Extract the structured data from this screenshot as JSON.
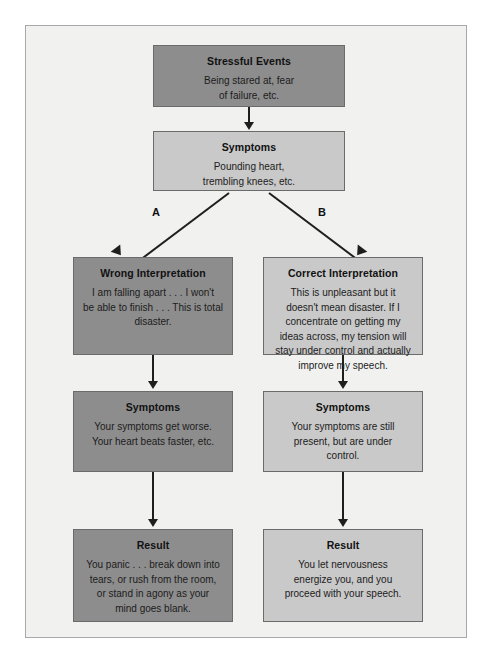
{
  "diagram": {
    "colors": {
      "page_background": "#ffffff",
      "panel_background": "#f1f1f0",
      "panel_border": "#a8a8a8",
      "node_dark": "#8d8d8d",
      "node_light": "#c9c9c9",
      "node_border": "#6b6b6b",
      "connector": "#1e1e1e",
      "text": "#1a1a1a"
    },
    "branch_labels": {
      "left": "A",
      "right": "B"
    },
    "nodes": {
      "stressful_events": {
        "title": "Stressful Events",
        "body": "Being stared at, fear\nof failure, etc."
      },
      "symptoms_top": {
        "title": "Symptoms",
        "body": "Pounding heart,\ntrembling knees, etc."
      },
      "wrong_interpretation": {
        "title": "Wrong Interpretation",
        "body": "I am falling apart . . . I won't\nbe able to finish . . . This is total\ndisaster."
      },
      "correct_interpretation": {
        "title": "Correct Interpretation",
        "body": "This is unpleasant but it\ndoesn't mean disaster. If I\nconcentrate on getting my\nideas across, my tension will\nstay under control and actually\nimprove my speech."
      },
      "symptoms_left": {
        "title": "Symptoms",
        "body": "Your symptoms get worse.\nYour heart beats faster, etc."
      },
      "symptoms_right": {
        "title": "Symptoms",
        "body": "Your symptoms are still\npresent, but are under\ncontrol."
      },
      "result_left": {
        "title": "Result",
        "body": "You panic . . . break down into\ntears, or rush from the room,\nor stand in agony as your\nmind goes blank."
      },
      "result_right": {
        "title": "Result",
        "body": "You let nervousness\nenergize you, and you\nproceed with your speech."
      }
    }
  }
}
